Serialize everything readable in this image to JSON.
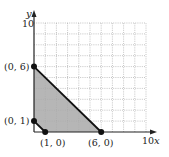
{
  "chart_data": {
    "type": "area",
    "title": "",
    "xlabel": "x",
    "ylabel": "y",
    "xlim": [
      0,
      10
    ],
    "ylim": [
      0,
      10
    ],
    "grid": true,
    "grid_step": 1,
    "x_tick_labels": [
      "10"
    ],
    "y_tick_labels": [
      "10"
    ],
    "region": {
      "description": "Shaded feasible region bounded by vertices",
      "vertices": [
        [
          0,
          1
        ],
        [
          1,
          0
        ],
        [
          6,
          0
        ],
        [
          0,
          6
        ]
      ],
      "fill": "#a9a9a9"
    },
    "boundary_lines": [
      {
        "from": [
          0,
          6
        ],
        "to": [
          6,
          0
        ]
      },
      {
        "from": [
          0,
          1
        ],
        "to": [
          1,
          0
        ]
      }
    ],
    "points": [
      {
        "x": 0,
        "y": 6,
        "label": "(0, 6)"
      },
      {
        "x": 0,
        "y": 1,
        "label": "(0, 1)"
      },
      {
        "x": 1,
        "y": 0,
        "label": "(1, 0)"
      },
      {
        "x": 6,
        "y": 0,
        "label": "(6, 0)"
      }
    ]
  },
  "labels": {
    "y_axis": "y",
    "x_axis": "x",
    "y_max": "10",
    "x_max": "10",
    "p06": "(0, 6)",
    "p01": "(0, 1)",
    "p10": "(1, 0)",
    "p60": "(6, 0)"
  },
  "colors": {
    "axis": "#222222",
    "grid": "#9a9a9a",
    "fill": "#a9a9a9",
    "points": "#111111"
  }
}
